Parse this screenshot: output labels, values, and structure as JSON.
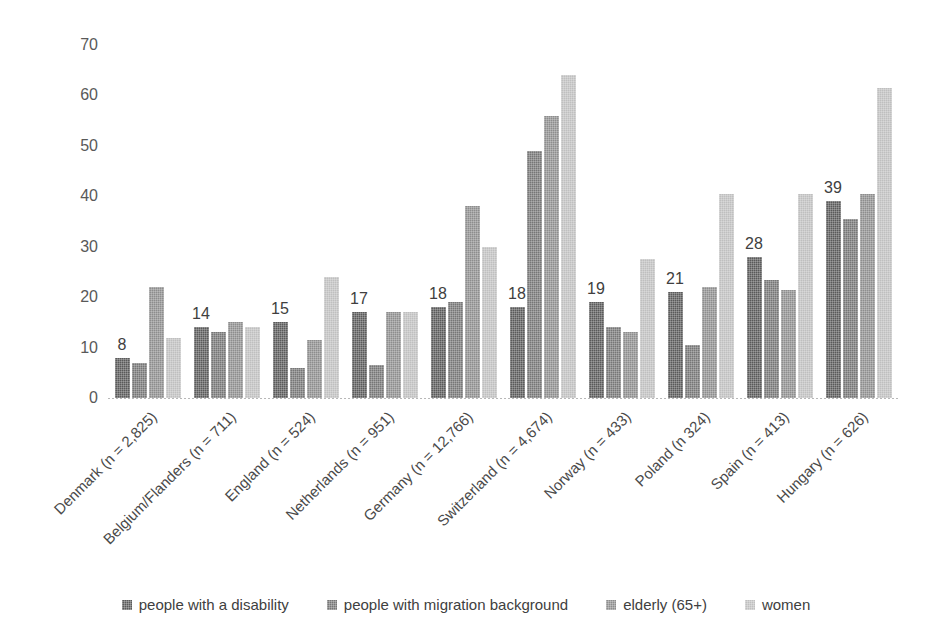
{
  "chart_data": {
    "type": "bar",
    "title": "",
    "subtitle": "",
    "xlabel": "",
    "ylabel": "",
    "ylim": [
      0,
      70
    ],
    "ytick_values": [
      0,
      10,
      20,
      30,
      40,
      50,
      60,
      70
    ],
    "ytick_labels": [
      "0",
      "10",
      "20",
      "30",
      "40",
      "50",
      "60",
      "70"
    ],
    "grid": false,
    "legend_position": "bottom",
    "categories": [
      "Denmark (n = 2,825)",
      "Belgium/Flanders (n = 711)",
      "England (n = 524)",
      "Netherlands (n = 951)",
      "Germany (n = 12,766)",
      "Switzerland (n = 4,674)",
      "Norway (n = 433)",
      "Poland (n 324)",
      "Spain (n = 413)",
      "Hungary (n = 626)"
    ],
    "series": [
      {
        "name": "people with a disability",
        "color": "#5a5a5a",
        "values": [
          8,
          14,
          15,
          17,
          18,
          18,
          19,
          21,
          28,
          39
        ],
        "data_labels": [
          "8",
          "14",
          "15",
          "17",
          "18",
          "18",
          "19",
          "21",
          "28",
          "39"
        ]
      },
      {
        "name": "people with migration background",
        "color": "#767676",
        "values": [
          7,
          13,
          6,
          6.5,
          19,
          49,
          14,
          10.5,
          23.5,
          35.5
        ],
        "data_labels": [
          "",
          "",
          "",
          "",
          "",
          "",
          "",
          "",
          "",
          ""
        ]
      },
      {
        "name": "elderly (65+)",
        "color": "#8d8d8d",
        "values": [
          22,
          15,
          11.5,
          17,
          38,
          56,
          13,
          22,
          21.5,
          40.5
        ],
        "data_labels": [
          "",
          "",
          "",
          "",
          "",
          "",
          "",
          "",
          "",
          ""
        ]
      },
      {
        "name": "women",
        "color": "#bfbfbf",
        "values": [
          12,
          14,
          24,
          17,
          30,
          64,
          27.5,
          40.5,
          40.5,
          61.5
        ],
        "data_labels": [
          "",
          "",
          "",
          "",
          "",
          "",
          "",
          "",
          "",
          ""
        ]
      }
    ]
  },
  "legend": {
    "items": [
      {
        "label": "people with a disability"
      },
      {
        "label": "people with migration background"
      },
      {
        "label": "elderly (65+)"
      },
      {
        "label": "women"
      }
    ]
  }
}
